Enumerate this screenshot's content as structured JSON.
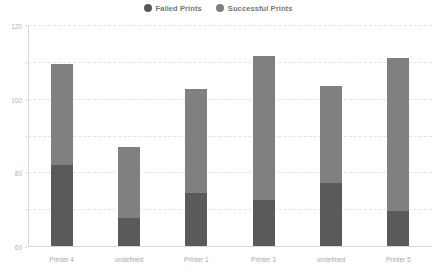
{
  "legend": {
    "position": "top-center",
    "entries": [
      {
        "label": "Failed Prints",
        "color": "#5a5a5a",
        "icon": "circle-swatch-icon"
      },
      {
        "label": "Successful Prints",
        "color": "#808080",
        "icon": "circle-swatch-icon"
      }
    ]
  },
  "chart_data": {
    "type": "bar",
    "stacked": true,
    "title": "",
    "xlabel": "",
    "ylabel": "",
    "ylim": [
      0,
      120
    ],
    "yticks": [
      0,
      20,
      40,
      60,
      80,
      100,
      120
    ],
    "ytick_labels": [
      "0",
      "20",
      "40",
      "60",
      "80",
      "100",
      "120"
    ],
    "grid": true,
    "grid_axis": "y",
    "categories": [
      "Printer 4",
      "undefined",
      "Printer 1",
      "Printer 3",
      "undefined",
      "Printer 5"
    ],
    "series": [
      {
        "name": "Failed Prints",
        "color": "#5a5a5a",
        "values": [
          44,
          15,
          29,
          25,
          34,
          19
        ]
      },
      {
        "name": "Successful Prints",
        "color": "#808080",
        "values": [
          55,
          39,
          56,
          78,
          53,
          83
        ]
      }
    ],
    "totals": [
      99,
      54,
      85,
      103,
      87,
      102
    ]
  },
  "colors": {
    "failed": "#5a5a5a",
    "successful": "#808080",
    "gridline": "#dfe5e8",
    "axis": "#d9d9d9",
    "tick_text": "#b3b3b3",
    "category_text": "#a8a8a8",
    "legend_text": "#767676",
    "background": "#ffffff"
  }
}
